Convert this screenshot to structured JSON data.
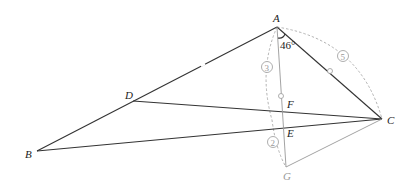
{
  "diagram": {
    "points": {
      "A": {
        "label": "A",
        "x": 277,
        "y": 27
      },
      "B": {
        "label": "B",
        "x": 37,
        "y": 151
      },
      "C": {
        "label": "C",
        "x": 382,
        "y": 119
      },
      "D": {
        "label": "D",
        "x": 133,
        "y": 101
      },
      "E": {
        "label": "E",
        "x": 283,
        "y": 126
      },
      "F": {
        "label": "F",
        "x": 284,
        "y": 110
      },
      "G": {
        "label": "G",
        "x": 286,
        "y": 167
      }
    },
    "angle_label": "46°",
    "arc_labels": {
      "arc3": "3",
      "arc5": "5",
      "arc2": "2"
    },
    "colors": {
      "main_line": "#333333",
      "construction_line": "#999999"
    }
  }
}
